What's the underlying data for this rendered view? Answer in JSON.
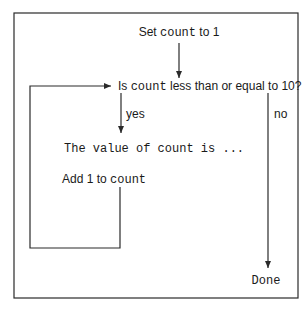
{
  "diagram": {
    "type": "flowchart",
    "nodes": {
      "init": {
        "prefix": "Set ",
        "code": "count",
        "suffix": " to 1"
      },
      "condition": {
        "prefix": "Is ",
        "code": "count",
        "suffix": " less than or equal to 10?"
      },
      "print": {
        "code": "The value of count is ..."
      },
      "increment": {
        "prefix": "Add 1 to ",
        "code": "count"
      },
      "done": {
        "code": "Done"
      }
    },
    "edges": {
      "yes_label": "yes",
      "no_label": "no"
    }
  }
}
